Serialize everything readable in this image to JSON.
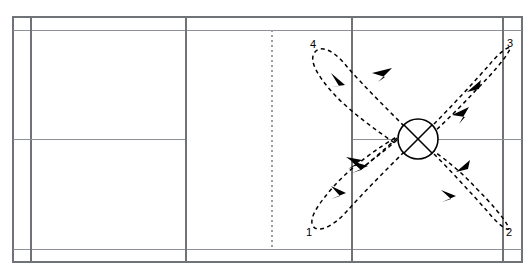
{
  "diagram": {
    "surface_color": "#ffffff",
    "line_color": "#6f7276",
    "path_color": "#000000",
    "width": 532,
    "height": 277
  },
  "court": {
    "outer_left": 13,
    "outer_right": 522,
    "outer_top": 17,
    "outer_bottom": 262,
    "singles_sideline_left": 31,
    "singles_sideline_right": 503,
    "doubles_long_service_top": 30,
    "doubles_long_service_bottom": 249,
    "short_service_line_left": 186,
    "short_service_line_right": 352,
    "net_x": 272,
    "centre_line_y": 139,
    "lines": [
      {
        "name": "outer-boundary",
        "type": "rect"
      },
      {
        "name": "doubles-long-service-line-top",
        "type": "horizontal"
      },
      {
        "name": "doubles-long-service-line-bottom",
        "type": "horizontal"
      },
      {
        "name": "centre-line",
        "type": "horizontal"
      },
      {
        "name": "singles-sideline-left",
        "type": "vertical"
      },
      {
        "name": "singles-sideline-right",
        "type": "vertical"
      },
      {
        "name": "short-service-line-left",
        "type": "vertical"
      },
      {
        "name": "short-service-line-right",
        "type": "vertical"
      },
      {
        "name": "net",
        "type": "vertical-dashed"
      }
    ]
  },
  "base_marker": {
    "name": "base-position",
    "glyph": "circle-with-cross",
    "cx": 418,
    "cy": 139,
    "r": 20
  },
  "corner_labels": [
    {
      "id": "1",
      "text": "1",
      "corner": "rear-bottom-left",
      "x": 306,
      "y": 227
    },
    {
      "id": "2",
      "text": "2",
      "corner": "rear-bottom-right",
      "x": 506,
      "y": 227
    },
    {
      "id": "3",
      "text": "3",
      "corner": "rear-top-right",
      "x": 507,
      "y": 38
    },
    {
      "id": "4",
      "text": "4",
      "corner": "rear-top-left",
      "x": 310,
      "y": 39
    }
  ],
  "movement_paths": [
    {
      "name": "path-base-to-corner-1",
      "description": "Out-and-back loop from base position to corner 1 (bottom-left)",
      "direction": "outbound-then-return",
      "style": "dashed-with-arrowheads"
    },
    {
      "name": "path-base-to-corner-2",
      "description": "Out-and-back loop from base position to corner 2 (bottom-right)",
      "direction": "outbound-then-return",
      "style": "dashed-with-arrowheads"
    },
    {
      "name": "path-base-to-corner-3",
      "description": "Out-and-back loop from base position to corner 3 (top-right)",
      "direction": "outbound-then-return",
      "style": "dashed-with-arrowheads"
    },
    {
      "name": "path-base-to-corner-4",
      "description": "Out-and-back loop from base position to corner 4 (top-left)",
      "direction": "outbound-then-return",
      "style": "dashed-with-arrowheads"
    }
  ]
}
